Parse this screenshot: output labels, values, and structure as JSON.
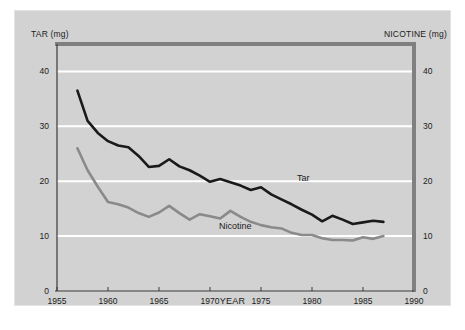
{
  "figure": {
    "background_color": "#d2d2d2",
    "frame_color": "#808080",
    "gridline_color": "#ffffff",
    "caption": ""
  },
  "labels": {
    "left_axis_title": "TAR (mg)",
    "right_axis_title": "NICOTINE (mg)",
    "x_axis_title": "YEAR",
    "series_tar": "Tar",
    "series_nicotine": "Nicotine"
  },
  "chart_data": {
    "type": "line",
    "title": "",
    "subtitle": "",
    "xlabel": "YEAR",
    "ylabel": "TAR (mg)",
    "y2label": "NICOTINE (mg)",
    "xlim": [
      1955,
      1990
    ],
    "ylim": [
      0,
      45
    ],
    "y2lim": [
      0,
      45
    ],
    "xticks": [
      1955,
      1960,
      1965,
      1970,
      1975,
      1980,
      1985,
      1990
    ],
    "yticks": [
      0,
      10,
      20,
      30,
      40
    ],
    "y2ticks": [
      0,
      10,
      20,
      30,
      40
    ],
    "grid": "horizontal",
    "legend": "inline-annotations",
    "x": [
      1957,
      1958,
      1959,
      1960,
      1961,
      1962,
      1963,
      1964,
      1965,
      1966,
      1967,
      1968,
      1969,
      1970,
      1971,
      1972,
      1973,
      1974,
      1975,
      1976,
      1977,
      1978,
      1979,
      1980,
      1981,
      1982,
      1983,
      1984,
      1985,
      1986,
      1987
    ],
    "series": [
      {
        "name": "Tar",
        "color": "#1a1a1a",
        "axis": "left",
        "units": "mg",
        "values": [
          36.5,
          31.0,
          28.8,
          27.3,
          26.5,
          26.2,
          24.6,
          22.6,
          22.8,
          24.0,
          22.7,
          22.0,
          21.0,
          19.9,
          20.4,
          19.8,
          19.2,
          18.4,
          18.9,
          17.6,
          16.7,
          15.8,
          14.8,
          13.9,
          12.7,
          13.7,
          13.0,
          12.2,
          12.5,
          12.8,
          12.6
        ]
      },
      {
        "name": "Nicotine",
        "color": "#8a8a8a",
        "axis": "right",
        "units": "mg",
        "values": [
          26.0,
          22.0,
          19.0,
          16.2,
          15.8,
          15.2,
          14.2,
          13.5,
          14.3,
          15.5,
          14.2,
          13.0,
          14.0,
          13.6,
          13.2,
          14.6,
          13.5,
          12.6,
          12.0,
          11.6,
          11.4,
          10.6,
          10.2,
          10.2,
          9.6,
          9.3,
          9.3,
          9.2,
          9.8,
          9.5,
          10.0
        ]
      }
    ]
  }
}
